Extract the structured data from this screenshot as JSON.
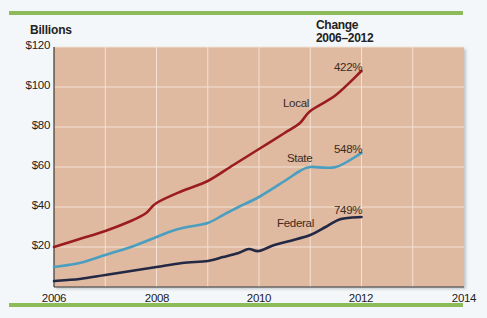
{
  "header": {
    "y_axis_title": "Billions",
    "change_title_line1": "Change",
    "change_title_line2": "2006–2012"
  },
  "colors": {
    "plot_background": "#dfb9a0",
    "gridline": "#f3e2d6",
    "rule": "#8dbb5a",
    "local": "#9b1c1f",
    "state": "#4a9fc0",
    "federal": "#232844"
  },
  "axes": {
    "y_ticks": [
      "$120",
      "$100",
      "$80",
      "$60",
      "$40",
      "$20"
    ],
    "x_ticks": [
      "2006",
      "2008",
      "2010",
      "2012",
      "2014"
    ]
  },
  "series_labels": {
    "local": "Local",
    "state": "State",
    "federal": "Federal",
    "local_change": "422%",
    "state_change": "548%",
    "federal_change": "749%"
  },
  "chart_data": {
    "type": "line",
    "title": "",
    "xlabel": "",
    "ylabel": "Billions",
    "xlim": [
      2006,
      2014
    ],
    "ylim": [
      0,
      120
    ],
    "y_ticks": [
      20,
      40,
      60,
      80,
      100,
      120
    ],
    "y_tick_labels": [
      "$20",
      "$40",
      "$60",
      "$80",
      "$100",
      "$120"
    ],
    "x_ticks": [
      2006,
      2008,
      2010,
      2012,
      2014
    ],
    "grid": true,
    "legend": "inline labels",
    "annotation_header": "Change 2006–2012",
    "series": [
      {
        "name": "Local",
        "change_2006_2012": "422%",
        "x": [
          2006,
          2006.5,
          2007,
          2007.5,
          2007.8,
          2008,
          2008.5,
          2009,
          2009.5,
          2010,
          2010.5,
          2010.8,
          2011,
          2011.5,
          2012
        ],
        "values": [
          20,
          24,
          28,
          33,
          37,
          42,
          48,
          53,
          61,
          69,
          77,
          82,
          88,
          96,
          108
        ]
      },
      {
        "name": "State",
        "change_2006_2012": "548%",
        "x": [
          2006,
          2006.5,
          2007,
          2007.5,
          2008,
          2008.3,
          2008.6,
          2009,
          2009.3,
          2009.6,
          2010,
          2010.5,
          2010.8,
          2011,
          2011.5,
          2012
        ],
        "values": [
          10,
          12,
          16,
          20,
          25,
          28,
          30,
          32,
          36,
          40,
          45,
          53,
          58,
          60,
          60,
          67
        ]
      },
      {
        "name": "Federal",
        "change_2006_2012": "749%",
        "x": [
          2006,
          2006.5,
          2007,
          2007.5,
          2008,
          2008.5,
          2009,
          2009.3,
          2009.6,
          2009.8,
          2010,
          2010.3,
          2010.6,
          2011,
          2011.3,
          2011.6,
          2012
        ],
        "values": [
          3,
          4,
          6,
          8,
          10,
          12,
          13,
          15,
          17,
          19,
          18,
          21,
          23,
          26,
          30,
          34,
          35
        ]
      }
    ]
  }
}
